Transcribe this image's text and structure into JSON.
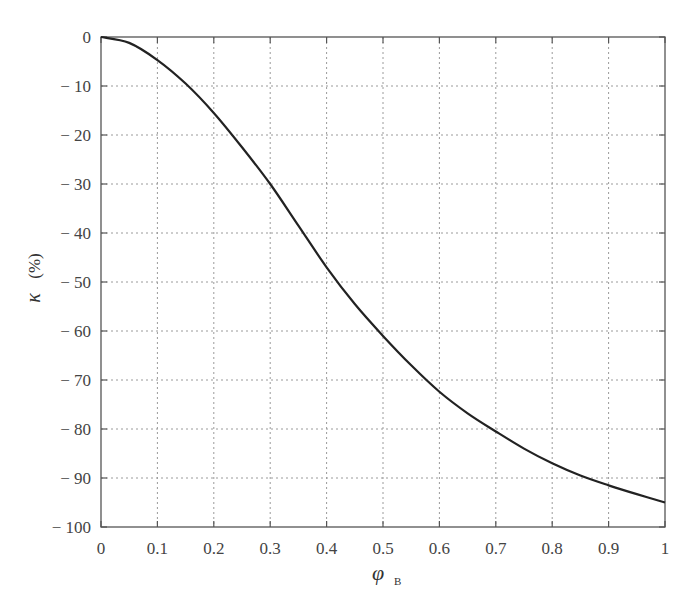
{
  "chart_data": {
    "type": "line",
    "title": "",
    "xlabel": "φ",
    "xlabel_subscript": "B",
    "ylabel": "κ",
    "ylabel_unit": "(%)",
    "xlim": [
      0,
      1
    ],
    "ylim": [
      -100,
      0
    ],
    "grid": true,
    "legend": null,
    "x_ticks": [
      "0",
      "0.1",
      "0.2",
      "0.3",
      "0.4",
      "0.5",
      "0.6",
      "0.7",
      "0.8",
      "0.9",
      "1"
    ],
    "y_ticks": [
      "0",
      "− 10",
      "− 20",
      "− 30",
      "− 40",
      "− 50",
      "− 60",
      "− 70",
      "− 80",
      "− 90",
      "− 100"
    ],
    "series": [
      {
        "name": "κ",
        "color": "#222222",
        "x": [
          0,
          0.05,
          0.1,
          0.15,
          0.2,
          0.25,
          0.3,
          0.35,
          0.4,
          0.45,
          0.5,
          0.55,
          0.6,
          0.65,
          0.7,
          0.75,
          0.8,
          0.85,
          0.9,
          0.95,
          1.0
        ],
        "values": [
          0,
          -1.2,
          -4.7,
          -9.5,
          -15.5,
          -22.5,
          -30,
          -38.5,
          -47,
          -54.5,
          -61,
          -67,
          -72.4,
          -76.8,
          -80.5,
          -84,
          -87,
          -89.5,
          -91.5,
          -93.3,
          -95
        ]
      }
    ]
  }
}
